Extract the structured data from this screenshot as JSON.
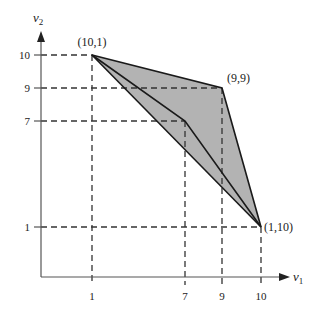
{
  "diagram": {
    "type": "feasible-region-plot",
    "axes": {
      "x": {
        "label": "v",
        "subscript": "1",
        "ticks": [
          "1",
          "7",
          "9",
          "10"
        ]
      },
      "y": {
        "label": "v",
        "subscript": "2",
        "ticks": [
          "10",
          "9",
          "7",
          "1"
        ]
      }
    },
    "points": {
      "p1": "(10,1)",
      "p2": "(9,9)",
      "p3": "(1,10)"
    },
    "colors": {
      "fill": "#b3b3b3",
      "line": "#1a1a1a",
      "dash": "#333333",
      "axis": "#555555"
    }
  }
}
